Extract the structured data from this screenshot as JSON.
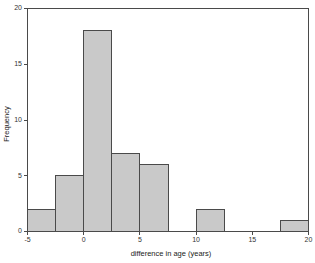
{
  "chart_data": {
    "type": "bar",
    "title": "",
    "subtitle": "",
    "xlabel": "difference in age (years)",
    "ylabel": "Frequency",
    "xlim": [
      -5,
      20
    ],
    "ylim": [
      0,
      20
    ],
    "bin_width": 2.5,
    "grid": false,
    "legend": null,
    "xticks": [
      -5,
      0,
      5,
      10,
      15,
      20
    ],
    "xtick_labels": [
      "-5",
      "0",
      "5",
      "10",
      "15",
      "20"
    ],
    "yticks": [
      0,
      5,
      10,
      15,
      20
    ],
    "ytick_labels": [
      "0",
      "5",
      "10",
      "15",
      "20"
    ],
    "bin_edges": [
      -5,
      -2.5,
      0,
      2.5,
      5,
      7.5,
      10,
      12.5,
      15,
      17.5,
      20
    ],
    "categories": [
      "-5 to -2.5",
      "-2.5 to 0",
      "0 to 2.5",
      "2.5 to 5",
      "5 to 7.5",
      "7.5 to 10",
      "10 to 12.5",
      "12.5 to 15",
      "15 to 17.5",
      "17.5 to 20"
    ],
    "values": [
      2,
      5,
      18,
      7,
      6,
      0,
      2,
      0,
      0,
      1
    ],
    "bar_fill_color": "#c9c9c9",
    "bar_edge_color": "#4a4a4a",
    "axis_color": "#4a4a4a",
    "background_color": "#ffffff"
  }
}
